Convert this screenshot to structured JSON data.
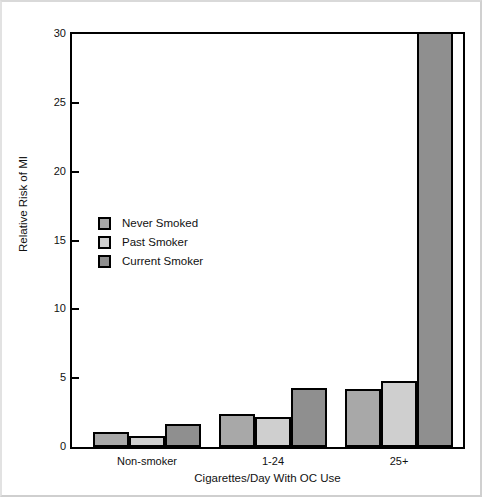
{
  "chart_data": {
    "type": "bar",
    "title": "",
    "xlabel": "Cigarettes/Day With OC Use",
    "ylabel": "Relative Risk of MI",
    "categories": [
      "Non-smoker",
      "1-24",
      "25+"
    ],
    "series": [
      {
        "name": "Never Smoked",
        "color": "#a8a8a8",
        "values": [
          1.1,
          2.4,
          4.2
        ]
      },
      {
        "name": "Past Smoker",
        "color": "#cfcfcf",
        "values": [
          0.8,
          2.2,
          4.8
        ]
      },
      {
        "name": "Current Smoker",
        "color": "#8f8f8f",
        "values": [
          1.7,
          4.3,
          30.2
        ]
      }
    ],
    "ylim": [
      0,
      30
    ],
    "yticks": [
      0,
      5,
      10,
      15,
      20,
      25,
      30
    ],
    "ytick_labels": [
      "0",
      "5",
      "10",
      "15",
      "20",
      "25",
      "30"
    ],
    "grid": false,
    "legend_position": "inside-left"
  }
}
